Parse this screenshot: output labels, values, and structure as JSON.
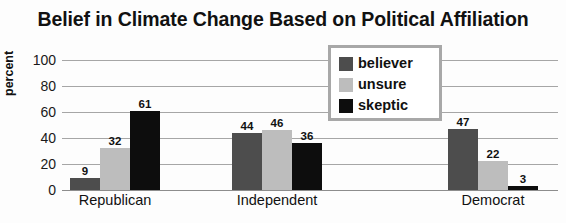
{
  "chart_data": {
    "type": "bar",
    "title": "Belief in Climate Change Based on Political Affiliation",
    "xlabel": "",
    "ylabel": "percent",
    "ylim": [
      0,
      100
    ],
    "yticks": [
      0,
      20,
      40,
      60,
      80,
      100
    ],
    "grid": true,
    "legend_position": "top-center-inside",
    "categories": [
      "Republican",
      "Independent",
      "Democrat"
    ],
    "series": [
      {
        "name": "believer",
        "color": "#4d4d4d",
        "values": [
          9,
          44,
          47
        ]
      },
      {
        "name": "unsure",
        "color": "#bdbdbd",
        "values": [
          32,
          46,
          22
        ]
      },
      {
        "name": "skeptic",
        "color": "#0d0d0d",
        "values": [
          61,
          36,
          3
        ]
      }
    ]
  }
}
